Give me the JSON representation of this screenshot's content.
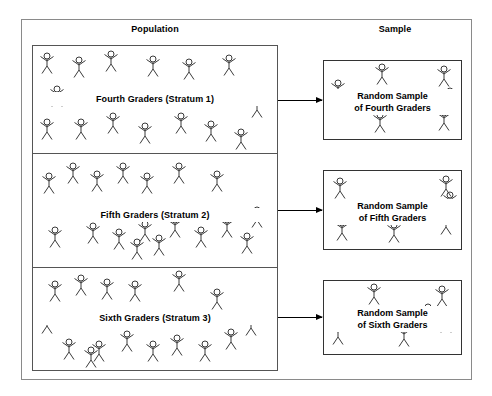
{
  "headings": {
    "population": "Population",
    "sample": "Sample"
  },
  "strata": [
    {
      "label": "Fourth Graders (Stratum 1)",
      "figure_count": 15,
      "figures": [
        {
          "x": 6,
          "y": 6
        },
        {
          "x": 38,
          "y": 10
        },
        {
          "x": 70,
          "y": 4
        },
        {
          "x": 112,
          "y": 9
        },
        {
          "x": 148,
          "y": 12
        },
        {
          "x": 188,
          "y": 8
        },
        {
          "x": 16,
          "y": 39
        },
        {
          "x": 216,
          "y": 50
        },
        {
          "x": 6,
          "y": 72
        },
        {
          "x": 40,
          "y": 72
        },
        {
          "x": 72,
          "y": 66
        },
        {
          "x": 104,
          "y": 76
        },
        {
          "x": 140,
          "y": 66
        },
        {
          "x": 170,
          "y": 74
        },
        {
          "x": 200,
          "y": 82
        }
      ]
    },
    {
      "label": "Fifth Graders (Stratum 2)",
      "figure_count": 18,
      "figures": [
        {
          "x": 8,
          "y": 18
        },
        {
          "x": 32,
          "y": 8
        },
        {
          "x": 56,
          "y": 16
        },
        {
          "x": 82,
          "y": 8
        },
        {
          "x": 106,
          "y": 18
        },
        {
          "x": 138,
          "y": 8
        },
        {
          "x": 176,
          "y": 16
        },
        {
          "x": 216,
          "y": 52
        },
        {
          "x": 14,
          "y": 72
        },
        {
          "x": 52,
          "y": 68
        },
        {
          "x": 78,
          "y": 74
        },
        {
          "x": 104,
          "y": 66
        },
        {
          "x": 118,
          "y": 80
        },
        {
          "x": 134,
          "y": 62
        },
        {
          "x": 160,
          "y": 72
        },
        {
          "x": 186,
          "y": 62
        },
        {
          "x": 96,
          "y": 84
        },
        {
          "x": 206,
          "y": 78
        }
      ]
    },
    {
      "label": "Sixth Graders (Stratum 3)",
      "figure_count": 16,
      "figures": [
        {
          "x": 14,
          "y": 12
        },
        {
          "x": 40,
          "y": 6
        },
        {
          "x": 66,
          "y": 10
        },
        {
          "x": 94,
          "y": 12
        },
        {
          "x": 138,
          "y": 2
        },
        {
          "x": 176,
          "y": 20
        },
        {
          "x": 6,
          "y": 44
        },
        {
          "x": 210,
          "y": 46
        },
        {
          "x": 28,
          "y": 70
        },
        {
          "x": 58,
          "y": 72
        },
        {
          "x": 86,
          "y": 62
        },
        {
          "x": 112,
          "y": 72
        },
        {
          "x": 136,
          "y": 66
        },
        {
          "x": 164,
          "y": 72
        },
        {
          "x": 190,
          "y": 60
        },
        {
          "x": 50,
          "y": 78
        }
      ]
    }
  ],
  "samples": [
    {
      "line1": "Random Sample",
      "line2": "of Fourth Graders",
      "figure_count": 6,
      "figures": [
        {
          "x": 6,
          "y": 18
        },
        {
          "x": 50,
          "y": 2
        },
        {
          "x": 112,
          "y": 4
        },
        {
          "x": 48,
          "y": 50
        },
        {
          "x": 112,
          "y": 48
        },
        {
          "x": 118,
          "y": 26
        }
      ]
    },
    {
      "line1": "Random Sample",
      "line2": "of Fifth Graders",
      "figure_count": 6,
      "figures": [
        {
          "x": 8,
          "y": 6
        },
        {
          "x": 114,
          "y": 4
        },
        {
          "x": 10,
          "y": 48
        },
        {
          "x": 62,
          "y": 50
        },
        {
          "x": 114,
          "y": 42
        },
        {
          "x": 118,
          "y": 20
        }
      ]
    },
    {
      "line1": "Random Sample",
      "line2": "of Sixth Graders",
      "figure_count": 6,
      "figures": [
        {
          "x": 42,
          "y": 2
        },
        {
          "x": 110,
          "y": 4
        },
        {
          "x": 6,
          "y": 42
        },
        {
          "x": 72,
          "y": 44
        },
        {
          "x": 114,
          "y": 30
        },
        {
          "x": 96,
          "y": 22
        }
      ]
    }
  ],
  "arrows": [
    {
      "name": "arrow-stratum-1-to-sample-1"
    },
    {
      "name": "arrow-stratum-2-to-sample-2"
    },
    {
      "name": "arrow-stratum-3-to-sample-3"
    }
  ],
  "colors": {
    "outer_frame": "#8a8a8a",
    "population_border": "#555555",
    "sample_border": "#333333",
    "figure_stroke": "#3a3a3a",
    "text": "#000000",
    "background": "#ffffff"
  }
}
